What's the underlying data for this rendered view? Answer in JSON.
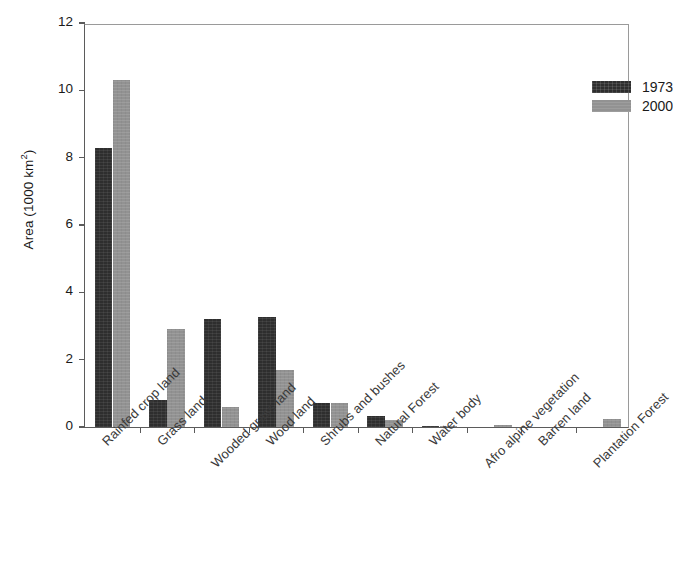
{
  "chart_data": {
    "type": "bar",
    "title": "",
    "xlabel": "",
    "ylabel": "Area (1000 km",
    "ylabel_sup": "2",
    "ylabel_tail": ")",
    "ylim": [
      0,
      12
    ],
    "yticks": [
      0,
      2,
      4,
      6,
      8,
      10,
      12
    ],
    "ytick_labels": [
      "0",
      "2",
      "4",
      "6",
      "8",
      "10",
      "12"
    ],
    "grid": false,
    "legend_position": "top-right",
    "categories": [
      "Rainfed crop land",
      "Grass land",
      "Wooded grass land",
      "Wood land",
      "Shrubs and bushes",
      "Natural Forest",
      "Water body",
      "Afro alpine vegetation",
      "Barren land",
      "Plantation Forest"
    ],
    "series": [
      {
        "name": "1973",
        "color": "#2e2e2e",
        "values": [
          8.28,
          0.8,
          3.22,
          3.28,
          0.72,
          0.32,
          0.02,
          0.0,
          0.0,
          0.0
        ]
      },
      {
        "name": "2000",
        "color": "#929292",
        "values": [
          10.3,
          2.9,
          0.6,
          1.7,
          0.72,
          0.22,
          0.02,
          0.06,
          0.0,
          0.25
        ]
      }
    ]
  },
  "legend": {
    "entries": [
      {
        "label": "1973"
      },
      {
        "label": "2000"
      }
    ]
  },
  "axes": {
    "y_title_text": "Area (1000 km",
    "y_title_sup": "2",
    "y_title_close": ")"
  }
}
